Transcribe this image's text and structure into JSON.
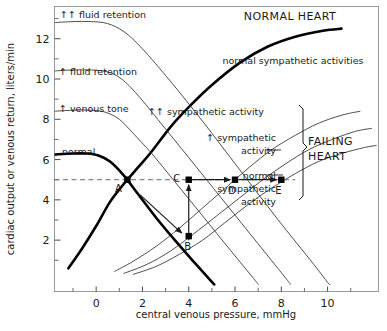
{
  "chart_data": {
    "type": "line",
    "title": "",
    "xlabel": "central venous pressure, mmHg",
    "ylabel": "cardiac output or venous return, liters/min",
    "xlim": [
      -1.8,
      12.2
    ],
    "ylim": [
      -0.55,
      13.6
    ],
    "xticks": [
      0,
      2,
      4,
      6,
      8,
      10
    ],
    "yticks": [
      2,
      4,
      6,
      8,
      10,
      12
    ],
    "xtick_labels": [
      "0",
      "2",
      "4",
      "6",
      "8",
      "10"
    ],
    "ytick_labels": [
      "2",
      "4",
      "6",
      "8",
      "10",
      "12"
    ],
    "grid": false,
    "legend_position": "inline-curve-labels",
    "series": [
      {
        "name": "normal cardiac output curve (NORMAL HEART, normal sympathetic activities)",
        "kind": "cardiac-output",
        "emphasis": "bold",
        "points": [
          [
            -1.2,
            0.6
          ],
          [
            -0.6,
            1.6
          ],
          [
            0.0,
            2.7
          ],
          [
            0.6,
            3.9
          ],
          [
            1.2,
            4.8
          ],
          [
            1.8,
            5.6
          ],
          [
            2.4,
            6.4
          ],
          [
            3.2,
            7.6
          ],
          [
            4.0,
            8.6
          ],
          [
            5.0,
            9.7
          ],
          [
            6.2,
            10.8
          ],
          [
            7.4,
            11.6
          ],
          [
            8.6,
            12.1
          ],
          [
            9.8,
            12.4
          ],
          [
            10.6,
            12.5
          ]
        ]
      },
      {
        "name": "↑↑ sympathetic activity (failing heart)",
        "kind": "cardiac-output",
        "emphasis": "thin",
        "points": [
          [
            0.8,
            0.45
          ],
          [
            1.6,
            0.95
          ],
          [
            2.6,
            1.7
          ],
          [
            3.6,
            2.6
          ],
          [
            4.6,
            3.6
          ],
          [
            5.6,
            4.6
          ],
          [
            6.6,
            5.6
          ],
          [
            7.6,
            6.5
          ],
          [
            8.6,
            7.2
          ],
          [
            9.6,
            7.8
          ],
          [
            10.6,
            8.2
          ],
          [
            11.4,
            8.4
          ]
        ]
      },
      {
        "name": "↑ sympathetic activity (failing heart)",
        "kind": "cardiac-output",
        "emphasis": "thin",
        "points": [
          [
            1.2,
            0.35
          ],
          [
            2.2,
            0.8
          ],
          [
            3.2,
            1.45
          ],
          [
            4.2,
            2.3
          ],
          [
            5.2,
            3.2
          ],
          [
            6.2,
            4.1
          ],
          [
            7.2,
            5.0
          ],
          [
            8.2,
            5.8
          ],
          [
            9.2,
            6.5
          ],
          [
            10.2,
            7.0
          ],
          [
            11.2,
            7.4
          ],
          [
            11.9,
            7.55
          ]
        ]
      },
      {
        "name": "normal sympathetic activity (failing heart)",
        "kind": "cardiac-output",
        "emphasis": "thin",
        "points": [
          [
            1.6,
            0.3
          ],
          [
            2.6,
            0.7
          ],
          [
            3.6,
            1.3
          ],
          [
            4.6,
            2.0
          ],
          [
            5.6,
            2.9
          ],
          [
            6.6,
            3.8
          ],
          [
            7.6,
            4.6
          ],
          [
            8.6,
            5.3
          ],
          [
            9.6,
            5.9
          ],
          [
            10.6,
            6.3
          ],
          [
            11.6,
            6.6
          ],
          [
            12.1,
            6.7
          ]
        ]
      },
      {
        "name": "normal venous return curve",
        "kind": "venous-return",
        "emphasis": "bold",
        "points": [
          [
            -1.8,
            6.25
          ],
          [
            -1.0,
            6.3
          ],
          [
            -0.4,
            6.3
          ],
          [
            0.1,
            6.2
          ],
          [
            0.6,
            5.9
          ],
          [
            1.2,
            5.2
          ],
          [
            1.8,
            4.3
          ],
          [
            2.6,
            3.1
          ],
          [
            3.4,
            2.0
          ],
          [
            4.2,
            0.95
          ],
          [
            4.9,
            0.05
          ],
          [
            5.1,
            -0.2
          ]
        ]
      },
      {
        "name": "↑ venous tone",
        "kind": "venous-return",
        "emphasis": "thin",
        "points": [
          [
            -1.8,
            8.4
          ],
          [
            -1.0,
            8.45
          ],
          [
            -0.2,
            8.45
          ],
          [
            0.4,
            8.35
          ],
          [
            1.0,
            8.0
          ],
          [
            1.6,
            7.3
          ],
          [
            2.4,
            6.3
          ],
          [
            3.4,
            4.9
          ],
          [
            4.6,
            3.2
          ],
          [
            5.8,
            1.5
          ],
          [
            6.8,
            0.1
          ],
          [
            7.0,
            -0.2
          ]
        ]
      },
      {
        "name": "↑ fluid retention",
        "kind": "venous-return",
        "emphasis": "thin",
        "points": [
          [
            -1.8,
            10.4
          ],
          [
            -1.0,
            10.45
          ],
          [
            -0.2,
            10.45
          ],
          [
            0.5,
            10.35
          ],
          [
            1.1,
            10.0
          ],
          [
            1.8,
            9.2
          ],
          [
            2.8,
            7.8
          ],
          [
            4.0,
            6.1
          ],
          [
            5.4,
            4.1
          ],
          [
            6.8,
            2.1
          ],
          [
            8.2,
            0.1
          ],
          [
            8.4,
            -0.2
          ]
        ]
      },
      {
        "name": "↑↑ fluid retention",
        "kind": "venous-return",
        "emphasis": "thin",
        "points": [
          [
            -1.8,
            12.8
          ],
          [
            -1.0,
            12.85
          ],
          [
            -0.2,
            12.85
          ],
          [
            0.5,
            12.75
          ],
          [
            1.2,
            12.35
          ],
          [
            2.0,
            11.5
          ],
          [
            3.2,
            9.9
          ],
          [
            4.6,
            7.9
          ],
          [
            6.2,
            5.5
          ],
          [
            7.8,
            3.1
          ],
          [
            9.4,
            0.8
          ],
          [
            10.0,
            -0.1
          ],
          [
            10.1,
            -0.2
          ]
        ]
      }
    ],
    "reference_line": {
      "type": "horizontal-dashed",
      "y": 5.0,
      "x_from": -1.8,
      "x_to": 8.6
    },
    "points": [
      {
        "label": "A",
        "x": 1.35,
        "y": 5.0,
        "label_dx": -9,
        "label_dy": 12
      },
      {
        "label": "B",
        "x": 4.0,
        "y": 2.2,
        "label_dx": -1,
        "label_dy": 14
      },
      {
        "label": "C",
        "x": 4.0,
        "y": 5.0,
        "label_dx": -12,
        "label_dy": 2
      },
      {
        "label": "D",
        "x": 6.0,
        "y": 5.0,
        "label_dx": -3,
        "label_dy": 14
      },
      {
        "label": "E",
        "x": 8.0,
        "y": 5.0,
        "label_dx": -3,
        "label_dy": 14
      }
    ],
    "arrows": [
      {
        "name": "A-to-B",
        "from": [
          1.9,
          4.25
        ],
        "to": [
          3.7,
          2.35
        ],
        "style": "solid"
      },
      {
        "name": "B-to-C",
        "from": [
          4.0,
          2.0
        ],
        "to": [
          4.0,
          4.75
        ],
        "style": "solid"
      },
      {
        "name": "C-to-D",
        "from": [
          4.15,
          5.0
        ],
        "to": [
          5.8,
          5.0
        ],
        "style": "solid"
      },
      {
        "name": "D-to-E",
        "from": [
          6.15,
          5.0
        ],
        "to": [
          7.8,
          5.0
        ],
        "style": "solid"
      }
    ],
    "annotations": [
      {
        "name": "normal-heart-title",
        "text": "NORMAL HEART",
        "x": 290,
        "y": 20,
        "anchor": "middle",
        "cls": "big-lbl"
      },
      {
        "name": "normal-sympathetic-activities",
        "text": "normal sympathetic activities",
        "x": 293,
        "y": 64,
        "anchor": "middle",
        "cls": "curve-lbl"
      },
      {
        "name": "fluid-retention-double",
        "text": "↑↑ fluid retention",
        "x": 60,
        "y": 18,
        "anchor": "start",
        "cls": "curve-lbl"
      },
      {
        "name": "fluid-retention-single",
        "text": "↑ fluid retention",
        "x": 59,
        "y": 75,
        "anchor": "start",
        "cls": "curve-lbl"
      },
      {
        "name": "venous-tone",
        "text": "↑ venous tone",
        "x": 59,
        "y": 112,
        "anchor": "start",
        "cls": "curve-lbl"
      },
      {
        "name": "normal-venous-return",
        "text": "normal",
        "x": 62,
        "y": 155,
        "anchor": "start",
        "cls": "curve-lbl"
      },
      {
        "name": "sympathetic-double",
        "text": "↑↑ sympathetic activity",
        "x": 206,
        "y": 115,
        "anchor": "middle",
        "cls": "curve-lbl"
      },
      {
        "name": "sympathetic-single-l1",
        "text": "↑ sympathetic",
        "x": 276,
        "y": 141,
        "anchor": "end",
        "cls": "curve-lbl"
      },
      {
        "name": "sympathetic-single-l2",
        "text": "activity",
        "x": 276,
        "y": 154,
        "anchor": "end",
        "cls": "curve-lbl"
      },
      {
        "name": "normal-sympathetic-l1",
        "text": "normal",
        "x": 276,
        "y": 179,
        "anchor": "end",
        "cls": "curve-lbl"
      },
      {
        "name": "normal-sympathetic-l2",
        "text": "sympathetic",
        "x": 276,
        "y": 192,
        "anchor": "end",
        "cls": "curve-lbl"
      },
      {
        "name": "normal-sympathetic-l3",
        "text": "activity",
        "x": 276,
        "y": 205,
        "anchor": "end",
        "cls": "curve-lbl"
      },
      {
        "name": "failing-heart-l1",
        "text": "FAILING",
        "x": 308,
        "y": 145,
        "anchor": "start",
        "cls": "big-lbl"
      },
      {
        "name": "failing-heart-l2",
        "text": "HEART",
        "x": 308,
        "y": 160,
        "anchor": "start",
        "cls": "big-lbl"
      }
    ],
    "leader_lines": [
      {
        "name": "leader-sympathetic-single",
        "from": [
          266,
          150
        ],
        "to": [
          281,
          150
        ]
      },
      {
        "name": "leader-normal-sympathetic",
        "from": [
          266,
          175
        ],
        "to": [
          283,
          175
        ]
      }
    ],
    "colors": {
      "ink": "#1a1a1a",
      "thin_curve": "#3a3a3a",
      "bold_curve": "#000000",
      "frame": "#9a9a9a",
      "dashed": "#6a6a6a",
      "background": "#ffffff"
    }
  },
  "axes_title_x": "central venous pressure, mmHg",
  "axes_title_y": "cardiac output or venous return, liters/min"
}
